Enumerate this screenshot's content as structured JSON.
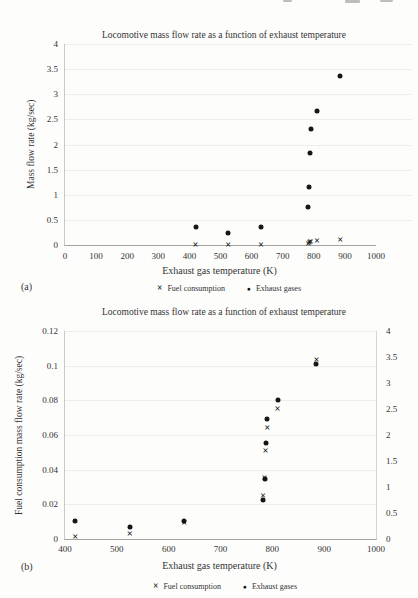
{
  "panels": {
    "a": "(a)",
    "b": "(b)"
  },
  "ink_color": "#1f1f1f",
  "chart_data": [
    {
      "type": "scatter",
      "panel": "a",
      "title": "Locomotive mass flow rate as a function of exhaust temperature",
      "xlabel": "Exhaust gas temperature (K)",
      "ylabel": "Mass flow rate (kg/sec)",
      "xlim": [
        0,
        1000
      ],
      "ylim": [
        0,
        4
      ],
      "grid": "horizontal-faint",
      "legend_position": "bottom",
      "x_ticks": {
        "values": [
          0,
          100,
          200,
          300,
          400,
          500,
          600,
          700,
          800,
          900,
          1000
        ],
        "labels": [
          "0",
          "100",
          "200",
          "300",
          "400",
          "500",
          "600",
          "700",
          "800",
          "900",
          "1000"
        ]
      },
      "y_ticks": {
        "values": [
          0,
          0.5,
          1,
          1.5,
          2,
          2.5,
          3,
          3.5,
          4
        ],
        "labels": [
          "0",
          "0.5",
          "1",
          "1.5",
          "2",
          "2.5",
          "3",
          "3.5",
          "4"
        ]
      },
      "series": [
        {
          "name": "Fuel consumption",
          "marker": "x",
          "x": [
            420,
            525,
            630,
            782,
            785,
            787,
            790,
            810,
            885
          ],
          "y": [
            0.001,
            0.003,
            0.009,
            0.025,
            0.035,
            0.051,
            0.064,
            0.075,
            0.103
          ]
        },
        {
          "name": "Exhaust gases",
          "marker": "circle",
          "x": [
            420,
            525,
            630,
            782,
            785,
            787,
            790,
            810,
            885
          ],
          "y": [
            0.35,
            0.23,
            0.35,
            0.75,
            1.16,
            1.84,
            2.3,
            2.67,
            3.37
          ]
        }
      ]
    },
    {
      "type": "scatter",
      "panel": "b",
      "title": "Locomotive mass flow rate as a function of exhaust temperature",
      "xlabel": "Exhaust gas temperature (K)",
      "ylabel": "Fuel consumption mass flow rate (kg/sec)",
      "xlim": [
        400,
        1000
      ],
      "ylim": [
        0,
        0.12
      ],
      "y2lim": [
        0,
        4
      ],
      "grid": "horizontal-faint",
      "legend_position": "bottom",
      "x_ticks": {
        "values": [
          400,
          500,
          600,
          700,
          800,
          900,
          1000
        ],
        "labels": [
          "400",
          "500",
          "600",
          "700",
          "800",
          "900",
          "1000"
        ]
      },
      "y_ticks": {
        "values": [
          0,
          0.02,
          0.04,
          0.06,
          0.08,
          0.1,
          0.12
        ],
        "labels": [
          "0",
          "0.02",
          "0.04",
          "0.06",
          "0.08",
          "0.1",
          "0.12"
        ]
      },
      "y2_ticks": {
        "values": [
          0,
          0.5,
          1,
          1.5,
          2,
          2.5,
          3,
          3.5,
          4
        ],
        "labels": [
          "0",
          "0.5",
          "1",
          "1.5",
          "2",
          "2.5",
          "3",
          "3.5",
          "4"
        ]
      },
      "series": [
        {
          "name": "Fuel consumption",
          "marker": "x",
          "axis": "left",
          "x": [
            420,
            525,
            630,
            782,
            785,
            787,
            790,
            810,
            885
          ],
          "y": [
            0.001,
            0.003,
            0.009,
            0.025,
            0.035,
            0.051,
            0.064,
            0.075,
            0.103
          ]
        },
        {
          "name": "Exhaust gases",
          "marker": "circle",
          "axis": "right",
          "x": [
            420,
            525,
            630,
            782,
            785,
            787,
            790,
            810,
            885
          ],
          "y": [
            0.35,
            0.23,
            0.35,
            0.75,
            1.16,
            1.84,
            2.3,
            2.67,
            3.37
          ]
        }
      ]
    }
  ]
}
